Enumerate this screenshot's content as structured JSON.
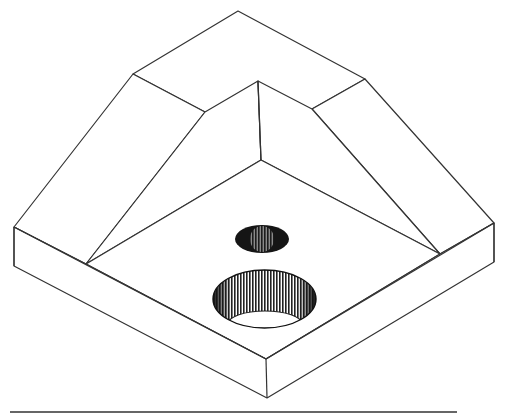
{
  "figure": {
    "title": "",
    "colors": {
      "line": "#333333",
      "fill": "#ffffff",
      "hole_dark": "#1a1a1a",
      "hatch": "#555555",
      "baseline": "#666666"
    },
    "parts": [
      {
        "name": "top-left-chamfer-face"
      },
      {
        "name": "top-right-chamfer-face"
      },
      {
        "name": "top-ridge-face"
      },
      {
        "name": "inner-pyramid-faces"
      },
      {
        "name": "base-plate"
      },
      {
        "name": "small-hole"
      },
      {
        "name": "large-counterbore-hole"
      }
    ]
  }
}
